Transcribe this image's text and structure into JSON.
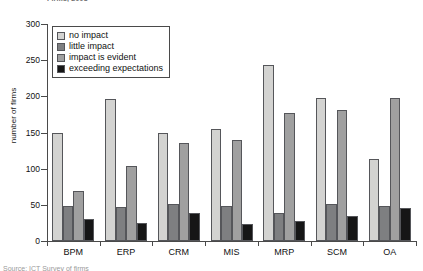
{
  "title_fragment": "Firms, 2008",
  "caption_fragment": "Source: ICT Survey of firms",
  "legend": {
    "items": [
      {
        "label": "no impact",
        "color": "#d3d3d1"
      },
      {
        "label": "little impact",
        "color": "#7e7f81"
      },
      {
        "label": "impact is evident",
        "color": "#a0a0a0"
      },
      {
        "label": "exceeding expectations",
        "color": "#161616"
      }
    ]
  },
  "chart_data": {
    "type": "bar",
    "title": "",
    "xlabel": "",
    "ylabel": "number of firms",
    "ylim": [
      0,
      300
    ],
    "yticks": [
      0,
      50,
      100,
      150,
      200,
      250,
      300
    ],
    "grid": false,
    "legend_position": "top-left",
    "categories": [
      "BPM",
      "ERP",
      "CRM",
      "MIS",
      "MRP",
      "SCM",
      "OA"
    ],
    "series": [
      {
        "name": "no impact",
        "color": "#d3d3d1",
        "values": [
          150,
          197,
          149,
          155,
          244,
          198,
          114
        ]
      },
      {
        "name": "little impact",
        "color": "#7e7f81",
        "values": [
          49,
          47,
          51,
          49,
          39,
          51,
          48
        ]
      },
      {
        "name": "impact is evident",
        "color": "#a0a0a0",
        "values": [
          69,
          104,
          135,
          139,
          177,
          181,
          198
        ]
      },
      {
        "name": "exceeding expectations",
        "color": "#161616",
        "values": [
          30,
          25,
          39,
          24,
          27,
          34,
          45
        ]
      }
    ]
  }
}
